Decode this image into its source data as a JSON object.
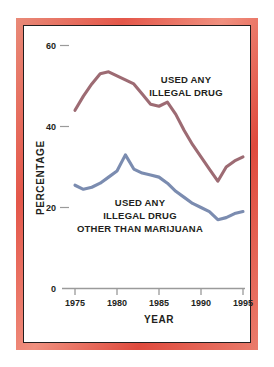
{
  "chart_data": {
    "type": "line",
    "title": "",
    "xlabel": "YEAR",
    "ylabel": "PERCENTAGE",
    "xlim": [
      1975,
      1995
    ],
    "ylim": [
      0,
      60
    ],
    "xticks": [
      1975,
      1980,
      1985,
      1990,
      1995
    ],
    "xtick_labels": [
      "1975",
      "1980",
      "1985",
      "1990",
      "1995"
    ],
    "yticks": [
      0,
      20,
      40,
      60
    ],
    "ytick_labels": [
      "0",
      "20",
      "40",
      "60"
    ],
    "grid": false,
    "legend_position": "inline-annotation",
    "x": [
      1975,
      1976,
      1977,
      1978,
      1979,
      1980,
      1981,
      1982,
      1983,
      1984,
      1985,
      1986,
      1987,
      1988,
      1989,
      1990,
      1991,
      1992,
      1993,
      1994,
      1995
    ],
    "series": [
      {
        "name": "USED ANY ILLEGAL DRUG",
        "color": "#9d6b73",
        "values": [
          44.0,
          47.5,
          50.5,
          53.0,
          53.5,
          52.5,
          51.5,
          50.5,
          48.0,
          45.5,
          45.0,
          46.0,
          43.0,
          39.0,
          35.5,
          32.5,
          29.5,
          26.5,
          30.0,
          31.5,
          32.5
        ]
      },
      {
        "name": "USED ANY ILLEGAL DRUG OTHER THAN MARIJUANA",
        "color": "#7b8cb0",
        "values": [
          25.5,
          24.5,
          25.0,
          26.0,
          27.5,
          29.0,
          33.0,
          29.5,
          28.5,
          28.0,
          27.5,
          26.0,
          24.0,
          22.5,
          21.0,
          20.0,
          19.0,
          17.0,
          17.5,
          18.5,
          19.0
        ]
      }
    ],
    "annotations": [
      {
        "id": "upper",
        "lines": [
          "USED ANY",
          "ILLEGAL DRUG"
        ],
        "series": "USED ANY ILLEGAL DRUG"
      },
      {
        "id": "lower",
        "lines": [
          "USED ANY",
          "ILLEGAL DRUG",
          "OTHER THAN MARIJUANA"
        ],
        "series": "USED ANY ILLEGAL DRUG OTHER THAN MARIJUANA"
      }
    ]
  },
  "frame": {
    "border_color": "#e4574a",
    "inner_rule_color": "#231f20",
    "paper_color": "#ffffff"
  },
  "axis": {
    "line_color": "#9a9a9a",
    "tick_color": "#9a9a9a"
  }
}
